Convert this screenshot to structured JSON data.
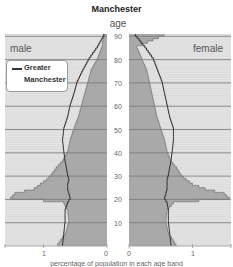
{
  "chart_data": {
    "type": "area",
    "subtype": "population-pyramid",
    "title": "Manchester",
    "ylabel": "age",
    "xlabel": "percentage of population in each age band",
    "panels": [
      "male",
      "female"
    ],
    "y_ticks": [
      10,
      20,
      30,
      40,
      50,
      60,
      70,
      80,
      90
    ],
    "x_ticks_male": [
      1,
      0
    ],
    "x_ticks_female": [
      0,
      1
    ],
    "xlim": [
      0,
      1.6
    ],
    "ylim": [
      0,
      90
    ],
    "legend": [
      "Greater Manchester"
    ],
    "grid": true,
    "ages": [
      0,
      5,
      10,
      15,
      18,
      19,
      20,
      22,
      24,
      26,
      28,
      30,
      33,
      36,
      40,
      45,
      50,
      55,
      60,
      65,
      70,
      75,
      80,
      85,
      90
    ],
    "series": [
      {
        "name": "Manchester male",
        "style": "filled",
        "values": [
          0.78,
          0.65,
          0.6,
          0.62,
          0.68,
          1.0,
          1.52,
          1.45,
          1.15,
          1.05,
          0.95,
          0.88,
          0.8,
          0.7,
          0.62,
          0.58,
          0.52,
          0.45,
          0.4,
          0.35,
          0.3,
          0.25,
          0.15,
          0.08,
          0.05
        ]
      },
      {
        "name": "Greater Manchester male",
        "style": "line",
        "values": [
          0.7,
          0.68,
          0.66,
          0.66,
          0.62,
          0.6,
          0.58,
          0.6,
          0.62,
          0.62,
          0.6,
          0.62,
          0.64,
          0.66,
          0.68,
          0.7,
          0.68,
          0.62,
          0.58,
          0.52,
          0.47,
          0.38,
          0.28,
          0.15,
          0.05
        ]
      },
      {
        "name": "Manchester female",
        "style": "filled",
        "values": [
          0.74,
          0.62,
          0.58,
          0.6,
          0.7,
          1.1,
          1.58,
          1.5,
          1.2,
          1.0,
          0.9,
          0.82,
          0.75,
          0.66,
          0.6,
          0.56,
          0.5,
          0.44,
          0.4,
          0.36,
          0.32,
          0.28,
          0.2,
          0.12,
          0.55
        ]
      },
      {
        "name": "Greater Manchester female",
        "style": "line",
        "values": [
          0.66,
          0.64,
          0.62,
          0.62,
          0.6,
          0.58,
          0.56,
          0.58,
          0.6,
          0.6,
          0.6,
          0.62,
          0.64,
          0.66,
          0.68,
          0.7,
          0.7,
          0.64,
          0.6,
          0.56,
          0.52,
          0.45,
          0.38,
          0.25,
          0.1
        ]
      }
    ]
  },
  "labels": {
    "title": "Manchester",
    "age": "age",
    "male": "male",
    "female": "female",
    "legend_line1": "Greater",
    "legend_line2": "Manchester",
    "x_male_1": "1",
    "x_male_0": "0",
    "x_female_0": "0",
    "x_female_1": "1",
    "x_title": "percentage of population in each age band"
  },
  "colors": {
    "band": "#dcdcdc",
    "fill": "#a9a9a9",
    "grid": "#777777",
    "line": "#333333"
  }
}
